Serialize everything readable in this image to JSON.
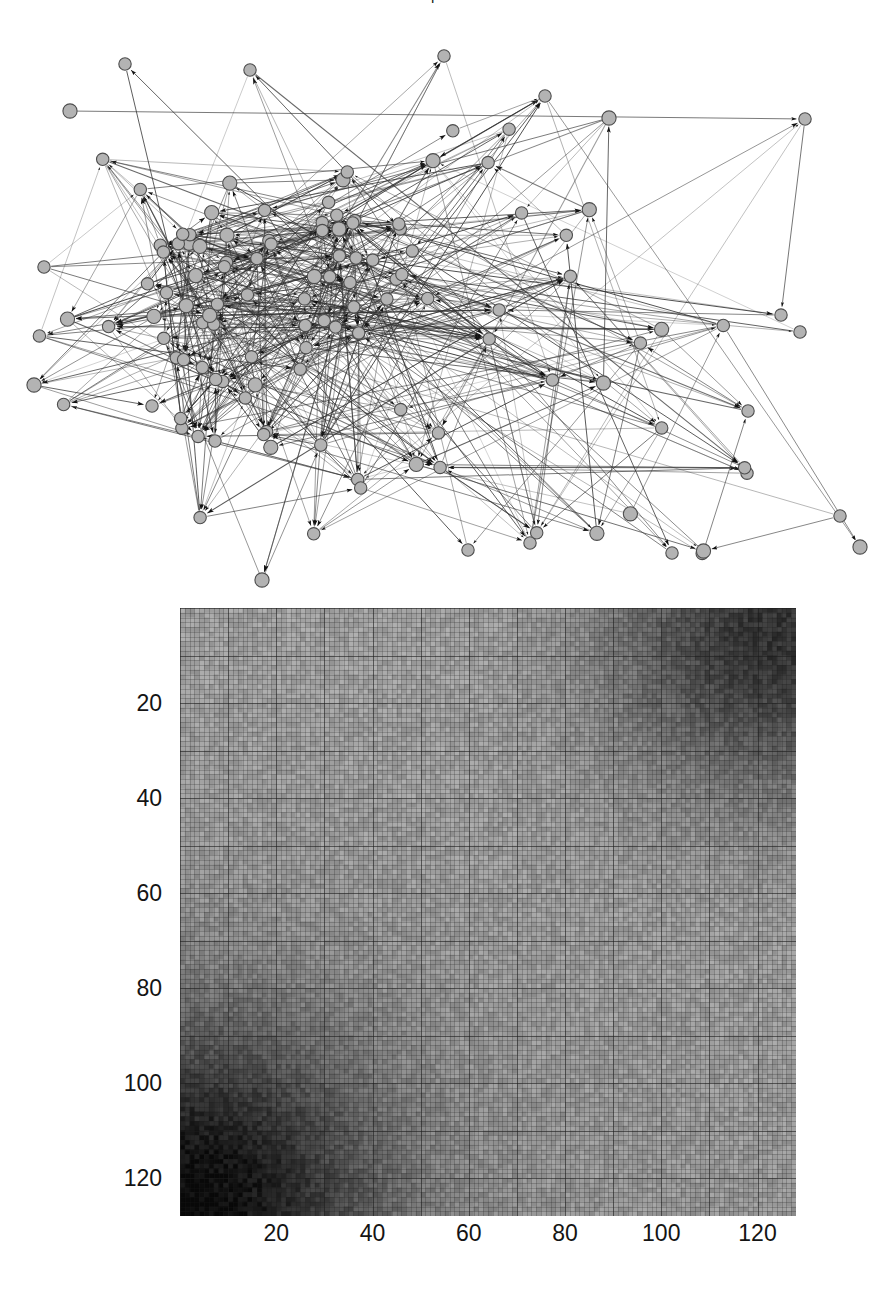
{
  "figure": {
    "title_fragment": "p",
    "panels": [
      "network-graph",
      "connectivity-matrix"
    ]
  },
  "graph": {
    "name": "directed-network-graph",
    "node_count": 131,
    "edge_count": 680,
    "node_fill": "#b3b3b3",
    "node_stroke": "#4d4d4d",
    "edge_color": "#333333",
    "arrowheads": true,
    "background": "#ffffff"
  },
  "chart_data": {
    "type": "heatmap",
    "title": "",
    "xlabel": "",
    "ylabel": "",
    "size": [
      128,
      128
    ],
    "xlim": [
      0,
      128
    ],
    "ylim": [
      0,
      128
    ],
    "x_ticks": [
      20,
      40,
      60,
      80,
      100,
      120
    ],
    "y_ticks": [
      20,
      40,
      60,
      80,
      100,
      120
    ],
    "grid": true,
    "legend": "none",
    "colormap": "gray",
    "value_range": [
      0,
      1
    ],
    "dark_regions": [
      "bottom-left",
      "top-right"
    ],
    "mean_level": 0.55
  },
  "axes": {
    "x_tick_labels": [
      "20",
      "40",
      "60",
      "80",
      "100",
      "120"
    ],
    "y_tick_labels": [
      "20",
      "40",
      "60",
      "80",
      "100",
      "120"
    ]
  }
}
